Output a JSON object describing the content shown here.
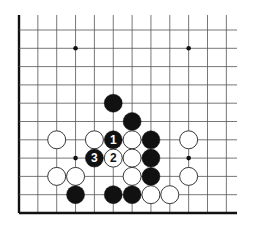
{
  "diagram": {
    "type": "go-board-fragment",
    "colors": {
      "background": "#ffffff",
      "line": "#555555",
      "edge": "#111111",
      "black_stone": "#111111",
      "white_stone": "#ffffff",
      "white_stone_outline": "#222222",
      "star_point": "#111111"
    },
    "grid": {
      "origin_x": 19,
      "origin_y": 213,
      "spacing_x": 18.85,
      "spacing_y": 18.3,
      "cols": 12,
      "rows": 11,
      "open_right_extend_to": 237,
      "open_top_extend_to": 15,
      "closed_edges": [
        "left",
        "bottom"
      ],
      "stone_radius": 9
    },
    "star_points": [
      {
        "col": 3,
        "row": 9
      },
      {
        "col": 9,
        "row": 9
      },
      {
        "col": 3,
        "row": 3
      },
      {
        "col": 9,
        "row": 3
      }
    ],
    "stones": [
      {
        "color": "black",
        "col": 5,
        "row": 6,
        "label": ""
      },
      {
        "color": "black",
        "col": 6,
        "row": 5,
        "label": ""
      },
      {
        "color": "white",
        "col": 2,
        "row": 4,
        "label": ""
      },
      {
        "color": "white",
        "col": 4,
        "row": 4,
        "label": ""
      },
      {
        "color": "black",
        "col": 5,
        "row": 4,
        "label": "1"
      },
      {
        "color": "white",
        "col": 6,
        "row": 4,
        "label": ""
      },
      {
        "color": "black",
        "col": 7,
        "row": 4,
        "label": ""
      },
      {
        "color": "white",
        "col": 9,
        "row": 4,
        "label": ""
      },
      {
        "color": "black",
        "col": 4,
        "row": 3,
        "label": "3"
      },
      {
        "color": "white",
        "col": 5,
        "row": 3,
        "label": "2"
      },
      {
        "color": "white",
        "col": 6,
        "row": 3,
        "label": ""
      },
      {
        "color": "black",
        "col": 7,
        "row": 3,
        "label": ""
      },
      {
        "color": "white",
        "col": 2,
        "row": 2,
        "label": ""
      },
      {
        "color": "white",
        "col": 3,
        "row": 2,
        "label": ""
      },
      {
        "color": "white",
        "col": 6,
        "row": 2,
        "label": ""
      },
      {
        "color": "black",
        "col": 7,
        "row": 2,
        "label": ""
      },
      {
        "color": "white",
        "col": 9,
        "row": 2,
        "label": ""
      },
      {
        "color": "black",
        "col": 3,
        "row": 1,
        "label": ""
      },
      {
        "color": "black",
        "col": 5,
        "row": 1,
        "label": ""
      },
      {
        "color": "black",
        "col": 6,
        "row": 1,
        "label": ""
      },
      {
        "color": "white",
        "col": 7,
        "row": 1,
        "label": ""
      },
      {
        "color": "white",
        "col": 8,
        "row": 1,
        "label": ""
      }
    ]
  }
}
